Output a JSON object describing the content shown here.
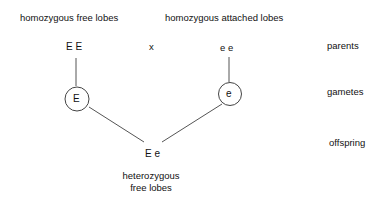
{
  "diagram": {
    "type": "genetic-cross",
    "parents": {
      "left_label": "homozygous free lobes",
      "right_label": "homozygous attached lobes",
      "left_genotype": "E E",
      "right_genotype": "e e",
      "cross_symbol": "x"
    },
    "gametes": {
      "left": "E",
      "right": "e"
    },
    "offspring": {
      "genotype": "E e",
      "phenotype_line1": "heterozygous",
      "phenotype_line2": "free lobes"
    },
    "row_labels": {
      "parents": "parents",
      "gametes": "gametes",
      "offspring": "offspring"
    },
    "colors": {
      "text": "#111111",
      "lines": "#555555",
      "background": "#ffffff"
    }
  }
}
